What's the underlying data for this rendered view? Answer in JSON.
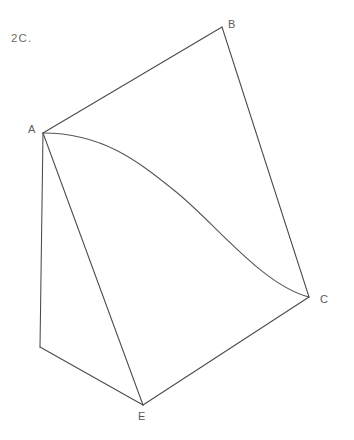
{
  "figure": {
    "caption": "2C.",
    "width": 354,
    "height": 440,
    "background_color": "#ffffff",
    "stroke_color": "#4a4a4a",
    "curve_stroke_color": "#555555",
    "label_color": "#5a5a5a",
    "vertices": [
      {
        "id": "A",
        "label": "A",
        "x": 43,
        "y": 133
      },
      {
        "id": "B",
        "label": "B",
        "x": 222,
        "y": 27
      },
      {
        "id": "C",
        "label": "C",
        "x": 309,
        "y": 297
      },
      {
        "id": "E",
        "label": "E",
        "x": 143,
        "y": 405
      },
      {
        "id": "D",
        "label": "",
        "x": 40,
        "y": 347
      }
    ],
    "edges": [
      {
        "name": "edge-A-B",
        "from": "A",
        "to": "B",
        "kind": "line",
        "path": "M 43 133 L 222 27"
      },
      {
        "name": "edge-B-C",
        "from": "B",
        "to": "C",
        "kind": "line",
        "path": "M 222 27 L 309 297"
      },
      {
        "name": "edge-C-E",
        "from": "C",
        "to": "E",
        "kind": "line",
        "path": "M 309 297 L 143 405"
      },
      {
        "name": "edge-E-D",
        "from": "E",
        "to": "D",
        "kind": "line",
        "path": "M 143 405 L 40 347"
      },
      {
        "name": "edge-D-A",
        "from": "D",
        "to": "A",
        "kind": "line",
        "path": "M 40 347 L 43 133"
      },
      {
        "name": "edge-A-E",
        "from": "A",
        "to": "E",
        "kind": "line",
        "path": "M 43 133 L 143 405"
      },
      {
        "name": "edge-A-C-curve",
        "from": "A",
        "to": "C",
        "kind": "curve",
        "path": "M 43 133 C 104 133 140 163 175 191 C 215 223 262 285 309 297"
      }
    ]
  }
}
